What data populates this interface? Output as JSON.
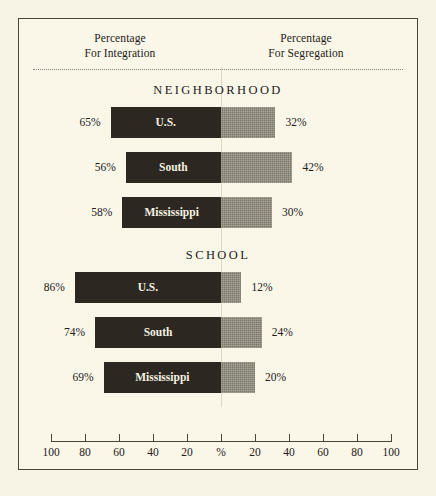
{
  "chart_data": {
    "type": "bar",
    "title": "",
    "orientation": "horizontal-diverging",
    "headers": {
      "left_line1": "Percentage",
      "left_line2": "For Integration",
      "right_line1": "Percentage",
      "right_line2": "For Segregation"
    },
    "axis": {
      "xlabel": "",
      "ylabel": "",
      "center_label": "%",
      "tick_labels": [
        "100",
        "80",
        "60",
        "40",
        "20",
        "%",
        "20",
        "40",
        "60",
        "80",
        "100"
      ],
      "tick_values": [
        -100,
        -80,
        -60,
        -40,
        -20,
        0,
        20,
        40,
        60,
        80,
        100
      ],
      "xlim": [
        -100,
        100
      ],
      "grid": false,
      "legend": "none"
    },
    "series": [
      {
        "name": "For Integration",
        "color": "#2c2821",
        "side": "left"
      },
      {
        "name": "For Segregation",
        "color": "#7e7b6b",
        "side": "right"
      }
    ],
    "sections": [
      {
        "title": "NEIGHBORHOOD",
        "rows": [
          {
            "label": "U.S.",
            "integration": 65,
            "segregation": 32,
            "integration_label": "65%",
            "segregation_label": "32%"
          },
          {
            "label": "South",
            "integration": 56,
            "segregation": 42,
            "integration_label": "56%",
            "segregation_label": "42%"
          },
          {
            "label": "Mississippi",
            "integration": 58,
            "segregation": 30,
            "integration_label": "58%",
            "segregation_label": "30%"
          }
        ]
      },
      {
        "title": "SCHOOL",
        "rows": [
          {
            "label": "U.S.",
            "integration": 86,
            "segregation": 12,
            "integration_label": "86%",
            "segregation_label": "12%"
          },
          {
            "label": "South",
            "integration": 74,
            "segregation": 24,
            "integration_label": "74%",
            "segregation_label": "24%"
          },
          {
            "label": "Mississippi",
            "integration": 69,
            "segregation": 20,
            "integration_label": "69%",
            "segregation_label": "20%"
          }
        ]
      }
    ]
  },
  "colors": {
    "background": "#faf7e9",
    "page": "#f7f4e6",
    "border": "#4a4638",
    "bar_integration": "#2c2821",
    "bar_segregation": "#7e7b6b",
    "text": "#23201a",
    "centerline": "#ddd9c4"
  }
}
